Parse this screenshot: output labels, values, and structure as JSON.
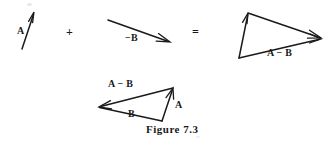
{
  "figure": {
    "caption": "Figure 7.3",
    "ink_color": "#1a1a1a",
    "background_color": "#ffffff",
    "equation": {
      "plus_sign": "+",
      "equals_sign": "="
    },
    "terms": [
      {
        "id": "term-a",
        "label": "A",
        "label_x": 17,
        "label_y": 26,
        "vector": {
          "x1": 22,
          "y1": 49,
          "x2": 34,
          "y2": 12
        }
      },
      {
        "id": "term-minus-b",
        "label": "−B",
        "label_x": 125,
        "label_y": 32,
        "vector": {
          "x1": 108,
          "y1": 20,
          "x2": 170,
          "y2": 42
        }
      },
      {
        "id": "result-triangle",
        "label": "A − B",
        "label_x": 267,
        "label_y": 47,
        "vertices": {
          "bottom_left": {
            "x": 239,
            "y": 58
          },
          "apex": {
            "x": 248,
            "y": 13
          },
          "right": {
            "x": 321,
            "y": 38
          }
        }
      }
    ],
    "verification_triangle": {
      "id": "verification-triangle",
      "labels": [
        {
          "id": "label-a-minus-b",
          "text": "A − B",
          "x": 108,
          "y": 84
        },
        {
          "id": "label-a",
          "text": "A",
          "x": 174,
          "y": 104
        },
        {
          "id": "label-b",
          "text": "B",
          "x": 128,
          "y": 113
        }
      ],
      "vertices": {
        "apex": {
          "x": 173,
          "y": 88
        },
        "left": {
          "x": 99,
          "y": 107
        },
        "bottom": {
          "x": 162,
          "y": 121
        }
      }
    },
    "caption_x": 146,
    "caption_y": 128
  }
}
